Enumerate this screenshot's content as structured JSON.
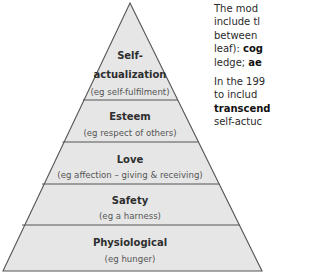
{
  "diagram": {
    "type": "pyramid",
    "colors": {
      "fill": "#e6e6e6",
      "stroke": "#555555",
      "title": "#2e2e2e",
      "subtitle": "#555555"
    },
    "levels": [
      {
        "title_lines": [
          "Self-",
          "actualization"
        ],
        "subtitle": "(eg self-fulfilment)"
      },
      {
        "title_lines": [
          "Esteem"
        ],
        "subtitle": "(eg respect of others)"
      },
      {
        "title_lines": [
          "Love"
        ],
        "subtitle": "(eg affection – giving & receiving)"
      },
      {
        "title_lines": [
          "Safety"
        ],
        "subtitle": "(eg a harness)"
      },
      {
        "title_lines": [
          "Physiological"
        ],
        "subtitle": "(eg hunger)"
      }
    ]
  },
  "side_text": {
    "paragraph1": {
      "line1": "The  mod",
      "line2": "include  tl",
      "line3": "between",
      "line4_pre": "leaf): ",
      "line4_bold": "cog",
      "line5_pre": "ledge; ",
      "line5_bold": "ae"
    },
    "paragraph2": {
      "line1": "In the 199",
      "line2": "to includ",
      "line3_bold": "transcend",
      "line4": "self-actuc"
    }
  }
}
